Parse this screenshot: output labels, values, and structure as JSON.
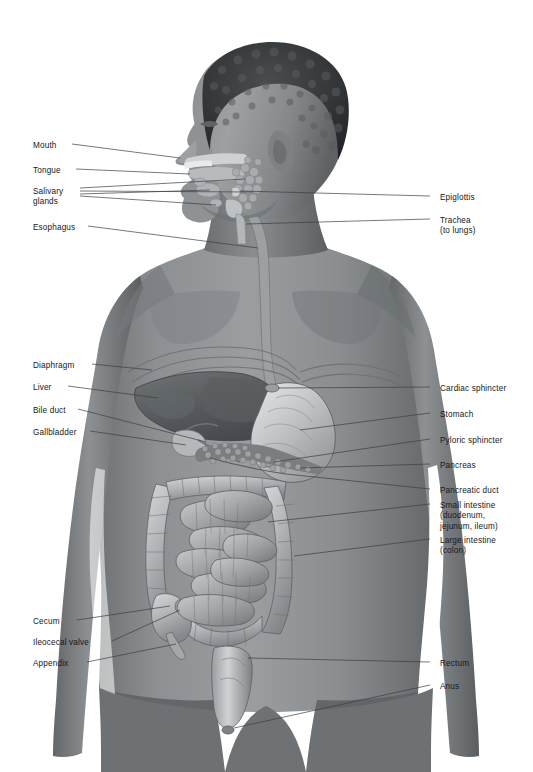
{
  "figure": {
    "background_color": "#ffffff",
    "skin_color": "#8c8f91",
    "skin_shadow_color": "#5f6365",
    "organ_color": "#b9bcbe",
    "organ_dark_color": "#6e7376",
    "leader_line_color": "#3b3f42",
    "label_text_color": "#16181a"
  },
  "labels_left": [
    {
      "id": "mouth",
      "text": "Mouth",
      "x": 33,
      "y": 141,
      "lines": [
        "Mouth"
      ]
    },
    {
      "id": "tongue",
      "text": "Tongue",
      "x": 33,
      "y": 166,
      "lines": [
        "Tongue"
      ]
    },
    {
      "id": "salivary-glands",
      "text": "Salivary glands",
      "x": 33,
      "y": 187,
      "lines": [
        "Salivary",
        "glands"
      ]
    },
    {
      "id": "esophagus",
      "text": "Esophagus",
      "x": 33,
      "y": 223,
      "lines": [
        "Esophagus"
      ]
    },
    {
      "id": "diaphragm",
      "text": "Diaphragm",
      "x": 33,
      "y": 361,
      "lines": [
        "Diaphragm"
      ]
    },
    {
      "id": "liver",
      "text": "Liver",
      "x": 33,
      "y": 383,
      "lines": [
        "Liver"
      ]
    },
    {
      "id": "bile-duct",
      "text": "Bile duct",
      "x": 33,
      "y": 406,
      "lines": [
        "Bile duct"
      ]
    },
    {
      "id": "gallbladder",
      "text": "Gallbladder",
      "x": 33,
      "y": 428,
      "lines": [
        "Gallbladder"
      ]
    },
    {
      "id": "cecum",
      "text": "Cecum",
      "x": 33,
      "y": 617,
      "lines": [
        "Cecum"
      ]
    },
    {
      "id": "ileocecal-valve",
      "text": "Ileocecal valve",
      "x": 33,
      "y": 638,
      "lines": [
        "Ileocecal valve"
      ]
    },
    {
      "id": "appendix",
      "text": "Appendix",
      "x": 33,
      "y": 659,
      "lines": [
        "Appendix"
      ]
    }
  ],
  "labels_right": [
    {
      "id": "epiglottis",
      "text": "Epiglottis",
      "x": 440,
      "y": 193,
      "lines": [
        "Epiglottis"
      ]
    },
    {
      "id": "trachea",
      "text": "Trachea (to lungs)",
      "x": 440,
      "y": 216,
      "lines": [
        "Trachea",
        "(to lungs)"
      ]
    },
    {
      "id": "cardiac-sphincter",
      "text": "Cardiac sphincter",
      "x": 440,
      "y": 384,
      "lines": [
        "Cardiac sphincter"
      ]
    },
    {
      "id": "stomach",
      "text": "Stomach",
      "x": 440,
      "y": 410,
      "lines": [
        "Stomach"
      ]
    },
    {
      "id": "pyloric-sphincter",
      "text": "Pyloric sphincter",
      "x": 440,
      "y": 436,
      "lines": [
        "Pyloric sphincter"
      ]
    },
    {
      "id": "pancreas",
      "text": "Pancreas",
      "x": 440,
      "y": 461,
      "lines": [
        "Pancreas"
      ]
    },
    {
      "id": "pancreatic-duct",
      "text": "Pancreatic duct",
      "x": 440,
      "y": 486,
      "lines": [
        "Pancreatic duct"
      ]
    },
    {
      "id": "small-intestine",
      "text": "Small intestine (duodenum, jejunum, ileum)",
      "x": 440,
      "y": 501,
      "lines": [
        "Small intestine",
        "(duodenum,",
        "jejunum, ileum)"
      ]
    },
    {
      "id": "large-intestine",
      "text": "Large intestine (colon)",
      "x": 440,
      "y": 536,
      "lines": [
        "Large intestine",
        "(colon)"
      ]
    },
    {
      "id": "rectum",
      "text": "Rectum",
      "x": 440,
      "y": 659,
      "lines": [
        "Rectum"
      ]
    },
    {
      "id": "anus",
      "text": "Anus",
      "x": 440,
      "y": 682,
      "lines": [
        "Anus"
      ]
    }
  ],
  "leader_lines": [
    {
      "id": "leader-mouth",
      "points": "72,144 180,158"
    },
    {
      "id": "leader-tongue",
      "points": "76,169 190,174"
    },
    {
      "id": "leader-salivary-1",
      "points": "80,190 245,180"
    },
    {
      "id": "leader-salivary-2",
      "points": "80,192 250,193"
    },
    {
      "id": "leader-salivary-3",
      "points": "80,194 248,205"
    },
    {
      "id": "leader-esophagus",
      "points": "88,226 258,246"
    },
    {
      "id": "leader-diaphragm",
      "points": "92,364 150,372"
    },
    {
      "id": "leader-liver",
      "points": "68,386 155,398"
    },
    {
      "id": "leader-bile-duct",
      "points": "78,409 176,428"
    },
    {
      "id": "leader-gallbladder",
      "points": "90,431 185,441"
    },
    {
      "id": "leader-cecum",
      "points": "77,620 176,597"
    },
    {
      "id": "leader-ileocecal",
      "points": "110,641 178,607"
    },
    {
      "id": "leader-appendix",
      "points": "87,662 182,618"
    },
    {
      "id": "leader-epiglottis",
      "points": "430,196 240,190"
    },
    {
      "id": "leader-trachea",
      "points": "430,219 245,221"
    },
    {
      "id": "leader-cardiac",
      "points": "430,387 330,381"
    },
    {
      "id": "leader-stomach",
      "points": "430,413 300,428"
    },
    {
      "id": "leader-pyloric",
      "points": "430,439 326,424"
    },
    {
      "id": "leader-pancreas",
      "points": "430,464 300,456"
    },
    {
      "id": "leader-pancreatic-duct",
      "points": "430,489 292,466"
    },
    {
      "id": "leader-small-intestine",
      "points": "430,504 282,514"
    },
    {
      "id": "leader-large-intestine",
      "points": "430,539 262,545"
    },
    {
      "id": "leader-rectum",
      "points": "430,662 250,649"
    },
    {
      "id": "leader-anus",
      "points": "430,685 238,690"
    }
  ]
}
